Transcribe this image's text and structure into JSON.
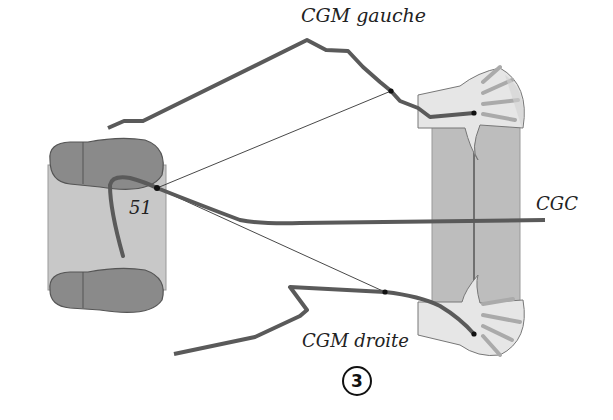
{
  "labels": {
    "cgm_left": "CGM gauche",
    "cgm_right": "CGM droite",
    "cgc": "CGC",
    "cylinder_number": "51",
    "figure_number": "3"
  },
  "colors": {
    "curve": "#5a5a5a",
    "cylinder_fill": "#c8c8c8",
    "foot_fill": "#8a8a8a",
    "bar_fill": "#bdbdbd",
    "hand_fill": "#e6e6e6",
    "thin_line": "#333333"
  }
}
